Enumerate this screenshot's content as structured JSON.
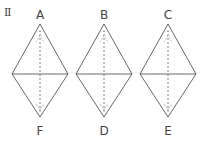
{
  "figure": {
    "number_label": "Ⅱ",
    "diamonds": [
      {
        "top_label": "A",
        "bottom_label": "F",
        "cx": 40
      },
      {
        "top_label": "B",
        "bottom_label": "D",
        "cx": 104
      },
      {
        "top_label": "C",
        "bottom_label": "E",
        "cx": 168
      }
    ],
    "geometry": {
      "half_width": 28,
      "top_y": 24,
      "mid_y": 74,
      "bottom_y": 117
    },
    "colors": {
      "stroke": "#555555",
      "text": "#444444",
      "background": "#ffffff"
    }
  }
}
